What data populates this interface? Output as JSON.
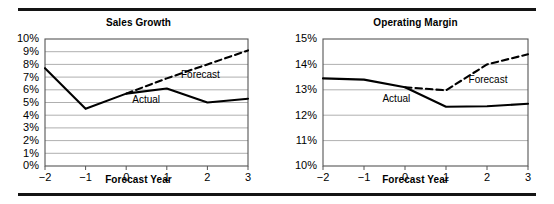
{
  "figure": {
    "rule_color": "#141414",
    "background": "#ffffff"
  },
  "charts": [
    {
      "id": "sales-growth",
      "title": "Sales Growth",
      "xlabel": "Forecast Year",
      "ylabel": "",
      "xtick_labels": [
        "−2",
        "−1",
        "0",
        "1",
        "2",
        "3"
      ],
      "ytick_labels": [
        "10%",
        "9%",
        "8%",
        "7%",
        "6%",
        "5%",
        "4%",
        "3%",
        "2%",
        "1%",
        "0%"
      ],
      "actual_label": "Actual",
      "forecast_label": "Forecast"
    },
    {
      "id": "operating-margin",
      "title": "Operating Margin",
      "xlabel": "Forecast Year",
      "ylabel": "",
      "xtick_labels": [
        "−2",
        "−1",
        "0",
        "1",
        "2",
        "3"
      ],
      "ytick_labels": [
        "15%",
        "14%",
        "13%",
        "12%",
        "11%",
        "10%"
      ],
      "actual_label": "Actual",
      "forecast_label": "Forecast"
    }
  ],
  "chart_data": [
    {
      "type": "line",
      "title": "Sales Growth",
      "xlabel": "Forecast Year",
      "ylabel": "",
      "xlim": [
        -2,
        3
      ],
      "ylim": [
        0,
        10
      ],
      "xticks": [
        -2,
        -1,
        0,
        1,
        2,
        3
      ],
      "yticks": [
        0,
        1,
        2,
        3,
        4,
        5,
        6,
        7,
        8,
        9,
        10
      ],
      "ytick_labels": [
        "0%",
        "1%",
        "2%",
        "3%",
        "4%",
        "5%",
        "6%",
        "7%",
        "8%",
        "9%",
        "10%"
      ],
      "grid": "horizontal",
      "legend": "inline-annotations",
      "series": [
        {
          "name": "Actual",
          "style": "solid",
          "color": "#000000",
          "x": [
            -2,
            -1,
            0,
            1,
            2,
            3
          ],
          "values": [
            7.7,
            4.5,
            5.7,
            6.1,
            5.0,
            5.3
          ]
        },
        {
          "name": "Forecast",
          "style": "dashed",
          "color": "#000000",
          "x": [
            0,
            1,
            2,
            3
          ],
          "values": [
            5.7,
            6.9,
            8.0,
            9.1
          ]
        }
      ],
      "annotations": [
        {
          "text": "Forecast",
          "x": 1.35,
          "y": 7.1
        },
        {
          "text": "Actual",
          "x": 0.15,
          "y": 5.15
        }
      ]
    },
    {
      "type": "line",
      "title": "Operating Margin",
      "xlabel": "Forecast Year",
      "ylabel": "",
      "xlim": [
        -2,
        3
      ],
      "ylim": [
        10,
        15
      ],
      "xticks": [
        -2,
        -1,
        0,
        1,
        2,
        3
      ],
      "yticks": [
        10,
        11,
        12,
        13,
        14,
        15
      ],
      "ytick_labels": [
        "10%",
        "11%",
        "12%",
        "13%",
        "14%",
        "15%"
      ],
      "grid": "horizontal",
      "legend": "inline-annotations",
      "series": [
        {
          "name": "Actual",
          "style": "solid",
          "color": "#000000",
          "x": [
            -2,
            -1,
            0,
            1,
            2,
            3
          ],
          "values": [
            13.45,
            13.4,
            13.1,
            12.33,
            12.35,
            12.45
          ]
        },
        {
          "name": "Forecast",
          "style": "dashed",
          "color": "#000000",
          "x": [
            0,
            1,
            2,
            3
          ],
          "values": [
            13.1,
            12.98,
            14.0,
            14.4
          ]
        }
      ],
      "annotations": [
        {
          "text": "Forecast",
          "x": 1.55,
          "y": 13.38
        },
        {
          "text": "Actual",
          "x": -0.55,
          "y": 12.62
        }
      ]
    }
  ]
}
